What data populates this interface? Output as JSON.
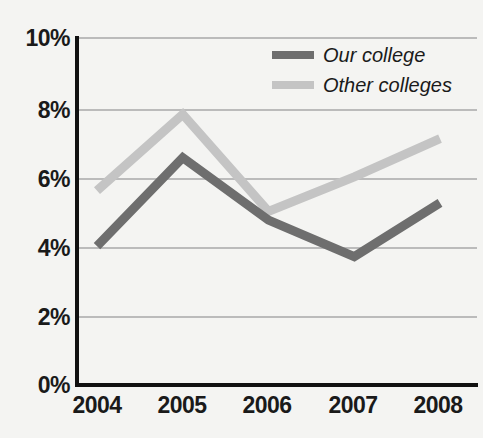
{
  "chart_data": {
    "type": "line",
    "title": "",
    "xlabel": "",
    "ylabel": "",
    "categories": [
      "2004",
      "2005",
      "2006",
      "2007",
      "2008"
    ],
    "x": [
      2004,
      2005,
      2006,
      2007,
      2008
    ],
    "series": [
      {
        "name": "Our college",
        "color": "#6e6e6e",
        "values": [
          4.0,
          6.55,
          4.75,
          3.7,
          5.25
        ]
      },
      {
        "name": "Other colleges",
        "color": "#c4c4c4",
        "values": [
          5.6,
          7.8,
          5.0,
          6.0,
          7.1
        ]
      }
    ],
    "ylim": [
      0,
      10
    ],
    "yticks": [
      0,
      2,
      4,
      6,
      8,
      10
    ],
    "ytick_labels": [
      "0%",
      "2%",
      "4%",
      "6%",
      "8%",
      "10%"
    ],
    "xtick_labels": [
      "2004",
      "2005",
      "2006",
      "2007",
      "2008"
    ],
    "grid": true,
    "grid_axis": "y",
    "grid_color": "#a8a8a8",
    "legend_position": "top-right",
    "axis_color": "#111111",
    "background": "#f4f4f2",
    "value_unit": "percent"
  },
  "yaxis": {
    "labels": [
      "10%",
      "8%",
      "6%",
      "4%",
      "2%",
      "0%"
    ]
  },
  "xaxis": {
    "labels": [
      "2004",
      "2005",
      "2006",
      "2007",
      "2008"
    ]
  },
  "legend": {
    "items": [
      {
        "label": "Our college",
        "color": "#6e6e6e"
      },
      {
        "label": "Other colleges",
        "color": "#c4c4c4"
      }
    ]
  }
}
